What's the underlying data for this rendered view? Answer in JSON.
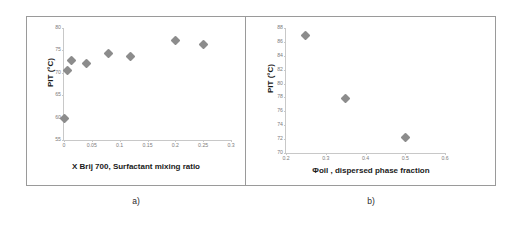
{
  "chart_data": [
    {
      "type": "scatter",
      "panel": "a",
      "caption": "a)",
      "title": "",
      "xlabel": "X Brij 700, Surfactant mixing ratio",
      "ylabel": "PIT (°C)",
      "xlim": [
        0,
        0.3
      ],
      "ylim": [
        55,
        80
      ],
      "xticks": [
        "0",
        "0.05",
        "0.1",
        "0.15",
        "0.2",
        "0.25",
        "0.3"
      ],
      "xtick_values": [
        0,
        0.05,
        0.1,
        0.15,
        0.2,
        0.25,
        0.3
      ],
      "yticks": [
        "55",
        "60",
        "65",
        "70",
        "75",
        "80"
      ],
      "ytick_values": [
        55,
        60,
        65,
        70,
        75,
        80
      ],
      "grid": false,
      "legend": "none",
      "marker": "diamond",
      "marker_color": "#8c8c8c",
      "x": [
        0,
        0.007,
        0.013,
        0.04,
        0.08,
        0.12,
        0.2,
        0.25
      ],
      "y": [
        59.8,
        70.5,
        72.7,
        72.0,
        74.4,
        73.6,
        77.1,
        76.3
      ]
    },
    {
      "type": "scatter",
      "panel": "b",
      "caption": "b)",
      "title": "",
      "xlabel": "Φoil , dispersed phase fraction",
      "ylabel": "PIT (°C)",
      "xlim": [
        0.2,
        0.6
      ],
      "ylim": [
        70,
        88
      ],
      "xticks": [
        "0.2",
        "0.3",
        "0.4",
        "0.5",
        "0.6"
      ],
      "xtick_values": [
        0.2,
        0.3,
        0.4,
        0.5,
        0.6
      ],
      "yticks": [
        "70",
        "72",
        "74",
        "76",
        "78",
        "80",
        "82",
        "84",
        "86",
        "88"
      ],
      "ytick_values": [
        70,
        72,
        74,
        76,
        78,
        80,
        82,
        84,
        86,
        88
      ],
      "grid": false,
      "legend": "none",
      "marker": "diamond",
      "marker_color": "#8c8c8c",
      "x": [
        0.25,
        0.35,
        0.5
      ],
      "y": [
        86.9,
        77.9,
        72.2
      ]
    }
  ],
  "figure": {
    "background": "#ffffff",
    "frame_color": "#9a9a9a",
    "axis_color": "#c8c8c8",
    "text_color": "#1a1a1a",
    "tick_text_color": "#7d7d7d"
  }
}
